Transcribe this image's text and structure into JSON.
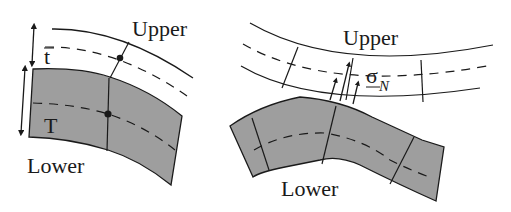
{
  "left_panel": {
    "upper_label": "Upper",
    "lower_label": "Lower",
    "thin_thickness_label": "t",
    "thick_thickness_label": "T"
  },
  "right_panel": {
    "upper_label": "Upper",
    "lower_label": "Lower",
    "stress_symbol": "σ",
    "stress_subscript": "N"
  },
  "colors": {
    "fill_gray": "#9e9e9e",
    "line": "#1a1a1a",
    "background": "#ffffff"
  }
}
